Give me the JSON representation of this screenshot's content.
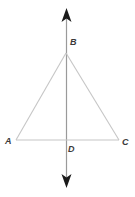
{
  "figure": {
    "background_color": "#ffffff",
    "width": 135,
    "height": 197
  },
  "colors": {
    "triangle_stroke": "#c6c6c6",
    "base_stroke": "#c6c6c6",
    "axis_stroke": "#9a9a9a",
    "arrow_fill": "#1a1a1a",
    "label_color": "#3a3a3a"
  },
  "labels": {
    "A": "A",
    "B": "B",
    "C": "C",
    "D": "D"
  },
  "geometry": {
    "points": {
      "A": {
        "x": 16,
        "y": 140
      },
      "B": {
        "x": 66,
        "y": 53
      },
      "C": {
        "x": 119,
        "y": 140
      },
      "D": {
        "x": 66,
        "y": 140
      }
    },
    "segments": [
      {
        "name": "AB",
        "from": "A",
        "to": "B"
      },
      {
        "name": "BC",
        "from": "B",
        "to": "C"
      },
      {
        "name": "AC",
        "from": "A",
        "to": "C"
      },
      {
        "name": "BD",
        "from": "B",
        "to": "D"
      }
    ],
    "axis_line": {
      "name": "vertical-line",
      "x": 66,
      "y_top": 9,
      "y_bottom": 188,
      "double_headed": true
    }
  },
  "icons": {
    "arrow_up": "arrow-up-icon",
    "arrow_down": "arrow-down-icon"
  }
}
